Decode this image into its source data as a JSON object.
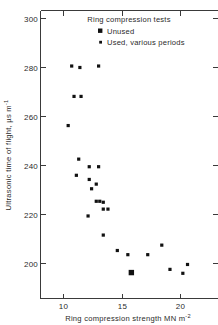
{
  "figure": {
    "background": "#ffffff",
    "ink_color": "#1a1a1a"
  },
  "axes": {
    "x_title_main": "Ring compression strength MN m",
    "x_title_exponent": "-2",
    "y_title_main": "Ultrasonic time of flight, µs m",
    "y_title_exponent": "-1",
    "x_ticks": [
      "10",
      "15",
      "20"
    ],
    "y_ticks": [
      "200",
      "220",
      "240",
      "260",
      "280",
      "300"
    ]
  },
  "legend": {
    "title": "Ring compression tests",
    "items": [
      {
        "label": "Unused",
        "marker": "large-filled-square",
        "color": "#111111"
      },
      {
        "label": "Used, various periods",
        "marker": "small-filled-square",
        "color": "#111111"
      }
    ]
  },
  "chart_data": {
    "type": "scatter",
    "title": "",
    "xlabel": "Ring compression strength MN m^-2",
    "ylabel": "Ultrasonic time of flight, µs m^-1",
    "xlim": [
      7.7,
      22.8
    ],
    "ylim": [
      190.5,
      305.0
    ],
    "xticks": [
      10,
      15,
      20
    ],
    "yticks": [
      200,
      220,
      240,
      260,
      280,
      300
    ],
    "grid": false,
    "legend_position": "top-right",
    "series": [
      {
        "name": "Used, various periods",
        "marker": "small-filled-square",
        "color": "#111111",
        "points": [
          {
            "x": 10.7,
            "y": 280.6
          },
          {
            "x": 11.4,
            "y": 280.0
          },
          {
            "x": 13.0,
            "y": 280.6
          },
          {
            "x": 10.9,
            "y": 268.2
          },
          {
            "x": 11.5,
            "y": 268.2
          },
          {
            "x": 10.4,
            "y": 256.3
          },
          {
            "x": 11.3,
            "y": 242.6
          },
          {
            "x": 12.2,
            "y": 239.5
          },
          {
            "x": 13.0,
            "y": 239.5
          },
          {
            "x": 11.1,
            "y": 236.0
          },
          {
            "x": 12.2,
            "y": 234.3
          },
          {
            "x": 12.8,
            "y": 232.4
          },
          {
            "x": 12.4,
            "y": 230.5
          },
          {
            "x": 12.8,
            "y": 225.4
          },
          {
            "x": 13.1,
            "y": 225.4
          },
          {
            "x": 13.4,
            "y": 225.0
          },
          {
            "x": 12.1,
            "y": 219.4
          },
          {
            "x": 13.4,
            "y": 222.2
          },
          {
            "x": 13.8,
            "y": 222.2
          },
          {
            "x": 13.4,
            "y": 211.6
          },
          {
            "x": 14.6,
            "y": 205.3
          },
          {
            "x": 15.5,
            "y": 203.6
          },
          {
            "x": 17.2,
            "y": 203.6
          },
          {
            "x": 18.4,
            "y": 207.5
          },
          {
            "x": 19.1,
            "y": 197.6
          },
          {
            "x": 20.2,
            "y": 196.0
          },
          {
            "x": 20.6,
            "y": 199.6
          }
        ]
      },
      {
        "name": "Unused",
        "marker": "large-filled-square",
        "color": "#111111",
        "points": [
          {
            "x": 15.8,
            "y": 196.3
          }
        ]
      }
    ]
  }
}
